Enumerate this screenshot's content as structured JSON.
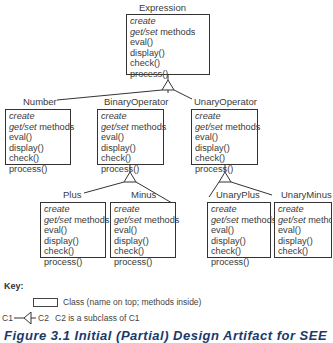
{
  "diagram": {
    "classes": [
      {
        "id": "expression",
        "name": "Expression",
        "methods": [
          "create",
          "get/set methods",
          "eval()",
          "display()",
          "check()",
          "process()"
        ]
      },
      {
        "id": "number",
        "name": "Number",
        "methods": [
          "create",
          "get/set methods",
          "eval()",
          "display()",
          "check()",
          "process()"
        ]
      },
      {
        "id": "binary-operator",
        "name": "BinaryOperator",
        "methods": [
          "create",
          "get/set methods",
          "eval()",
          "display()",
          "check()",
          "process()"
        ]
      },
      {
        "id": "unary-operator",
        "name": "UnaryOperator",
        "methods": [
          "create",
          "get/set methods",
          "eval()",
          "display()",
          "check()",
          "process()"
        ]
      },
      {
        "id": "plus",
        "name": "Plus",
        "methods": [
          "create",
          "get/set methods",
          "eval()",
          "display()",
          "check()",
          "process()"
        ]
      },
      {
        "id": "minus",
        "name": "Minus",
        "methods": [
          "create",
          "get/set methods",
          "eval()",
          "display()",
          "check()",
          "process()"
        ]
      },
      {
        "id": "unary-plus",
        "name": "UnaryPlus",
        "methods": [
          "create",
          "get/set methods",
          "eval()",
          "display()",
          "check()",
          "process()"
        ]
      },
      {
        "id": "unary-minus",
        "name": "UnaryMinus",
        "methods": [
          "create",
          "get/set methods",
          "eval()",
          "display()",
          "check()",
          "process()"
        ]
      }
    ],
    "method_parts": {
      "get_set_italic": "get/set",
      "get_set_rest": " methods"
    },
    "relations": [
      {
        "parent": "Expression",
        "children": [
          "Number",
          "BinaryOperator",
          "UnaryOperator"
        ]
      },
      {
        "parent": "BinaryOperator",
        "children": [
          "Plus",
          "Minus"
        ]
      },
      {
        "parent": "UnaryOperator",
        "children": [
          "UnaryPlus",
          "UnaryMinus"
        ]
      }
    ]
  },
  "key": {
    "title": "Key:",
    "class_desc": "Class (name on top; methods inside)",
    "subclass_c1": "C1",
    "subclass_c2": "C2",
    "subclass_desc": "C2 is a subclass of C1"
  },
  "caption": "Figure 3.1  Initial (Partial) Design Artifact for SEE"
}
